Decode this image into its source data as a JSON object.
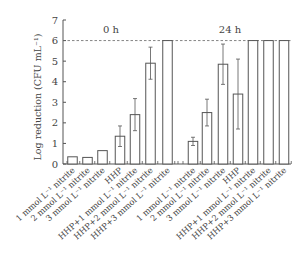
{
  "chart_data": {
    "type": "bar",
    "title": "",
    "xlabel": "",
    "ylabel": "Log reduction (CFU mL⁻¹)",
    "ylim": [
      0,
      7
    ],
    "yticks": [
      0,
      1,
      2,
      3,
      4,
      5,
      6,
      7
    ],
    "grid": false,
    "reference_line": {
      "y": 6,
      "style": "dashed"
    },
    "groups": [
      {
        "name": "0 h",
        "categories": [
          "1 mmol L⁻¹ nitrite",
          "2 mmol L⁻¹ nitrite",
          "3 mmol L⁻¹ nitrite",
          "HHP",
          "HHP+1 mmol L⁻¹ nitrite",
          "HHP+2 mmol L⁻¹ nitrite",
          "HHP+3 mmol L⁻¹ nitrite"
        ],
        "values": [
          0.35,
          0.32,
          0.65,
          1.35,
          2.4,
          4.9,
          6.0
        ],
        "errors": [
          0.03,
          0.03,
          0.03,
          0.5,
          0.78,
          0.78,
          0
        ]
      },
      {
        "name": "24 h",
        "categories": [
          "1 mmol L⁻¹ nitrite",
          "2 mmol L⁻¹ nitrite",
          "3 mmol L⁻¹ nitrite",
          "HHP",
          "HHP+1 mmol L⁻¹ nitrite",
          "HHP+2 mmol L⁻¹ nitrite",
          "HHP+3 mmol L⁻¹ nitrite"
        ],
        "values": [
          1.1,
          2.5,
          4.85,
          3.4,
          6.0,
          6.0,
          6.0
        ],
        "errors": [
          0.2,
          0.65,
          0.98,
          1.7,
          0,
          0,
          0
        ]
      }
    ]
  },
  "labels": {
    "group0": "0 h",
    "group1": "24 h"
  }
}
